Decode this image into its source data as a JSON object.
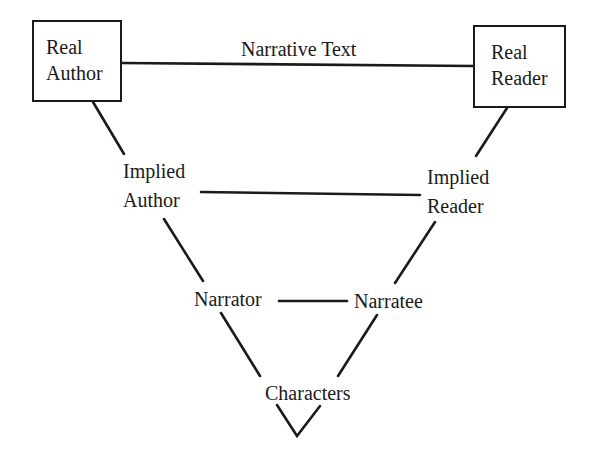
{
  "diagram": {
    "type": "communication-model",
    "colors": {
      "ink": "#1a1a1a",
      "background": "#ffffff"
    },
    "nodes": {
      "real_author": {
        "line1": "Real",
        "line2": "Author",
        "boxed": true
      },
      "real_reader": {
        "line1": "Real",
        "line2": "Reader",
        "boxed": true
      },
      "implied_author": {
        "line1": "Implied",
        "line2": "Author",
        "boxed": false
      },
      "implied_reader": {
        "line1": "Implied",
        "line2": "Reader",
        "boxed": false
      },
      "narrator": {
        "label": "Narrator",
        "boxed": false
      },
      "narratee": {
        "label": "Narratee",
        "boxed": false
      },
      "characters": {
        "label": "Characters",
        "boxed": false
      }
    },
    "edges": [
      {
        "from": "real_author",
        "to": "real_reader",
        "label": "Narrative Text"
      },
      {
        "from": "real_author",
        "to": "implied_author"
      },
      {
        "from": "real_reader",
        "to": "implied_reader"
      },
      {
        "from": "implied_author",
        "to": "implied_reader"
      },
      {
        "from": "implied_author",
        "to": "narrator"
      },
      {
        "from": "implied_reader",
        "to": "narratee"
      },
      {
        "from": "narrator",
        "to": "narratee"
      },
      {
        "from": "narrator",
        "to": "characters"
      },
      {
        "from": "narratee",
        "to": "characters"
      }
    ],
    "narrative_text_label": "Narrative Text"
  }
}
